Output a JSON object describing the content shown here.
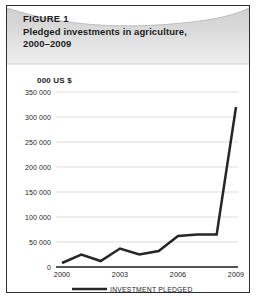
{
  "figure": {
    "label": "FIGURE 1",
    "title_line1": "Pledged investments in agriculture,",
    "title_line2": "2000–2009",
    "border_color": "#2e2e2e",
    "banner_color": "#d5d5d5"
  },
  "chart_data": {
    "type": "line",
    "title": "Pledged investments in agriculture, 2000–2009",
    "subtitle": "FIGURE 1",
    "xlabel": "",
    "ylabel": "000 US $",
    "ylim": [
      0,
      350000
    ],
    "xlim": [
      2000,
      2009
    ],
    "grid": true,
    "legend_position": "bottom",
    "series_color": "#262626",
    "ytick_labels": [
      "350 000",
      "300 000",
      "250 000",
      "200 000",
      "150 000",
      "100 000",
      "50 000",
      "0"
    ],
    "ytick_values": [
      350000,
      300000,
      250000,
      200000,
      150000,
      100000,
      50000,
      0
    ],
    "xtick_labels": [
      "2000",
      "2003",
      "2006",
      "2009"
    ],
    "xtick_values": [
      2000,
      2003,
      2006,
      2009
    ],
    "x": [
      2000,
      2001,
      2002,
      2003,
      2004,
      2005,
      2006,
      2007,
      2008,
      2009
    ],
    "series": [
      {
        "name": "INVESTMENT PLEDGED",
        "values": [
          8000,
          25000,
          12000,
          37000,
          25000,
          32000,
          62000,
          65000,
          65000,
          320000
        ]
      }
    ]
  },
  "legend": {
    "entries": [
      {
        "label": "INVESTMENT PLEDGED",
        "color": "#262626"
      }
    ]
  }
}
